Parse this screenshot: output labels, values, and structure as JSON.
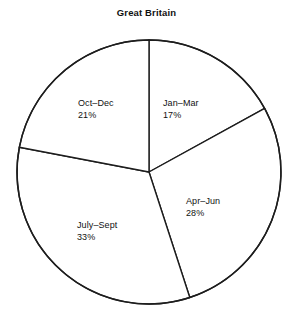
{
  "chart_data": {
    "type": "pie",
    "title": "Great Britain",
    "xlabel": "",
    "ylabel": "",
    "categories": [
      "Jan–Mar",
      "Apr–Jun",
      "July–Sept",
      "Oct–Dec"
    ],
    "values": [
      17,
      28,
      33,
      21
    ],
    "value_labels": [
      "17%",
      "28%",
      "33%",
      "21%"
    ],
    "units": "percent",
    "start_angle_deg": 0,
    "direction": "clockwise",
    "legend": "none",
    "grid": false,
    "slices": [
      {
        "label": "Jan–Mar",
        "value": 17,
        "value_label": "17%",
        "start_deg": 0,
        "end_deg": 61.2,
        "fill": "#ffffff",
        "stroke": "#1d1d1d"
      },
      {
        "label": "Apr–Jun",
        "value": 28,
        "value_label": "28%",
        "start_deg": 61.2,
        "end_deg": 162,
        "fill": "#ffffff",
        "stroke": "#1d1d1d"
      },
      {
        "label": "July–Sept",
        "value": 33,
        "value_label": "33%",
        "start_deg": 162,
        "end_deg": 280.8,
        "fill": "#ffffff",
        "stroke": "#1d1d1d"
      },
      {
        "label": "Oct–Dec",
        "value": 21,
        "value_label": "21%",
        "start_deg": 280.8,
        "end_deg": 360,
        "fill": "#ffffff",
        "stroke": "#1d1d1d"
      }
    ]
  },
  "geometry": {
    "center_x": 149,
    "center_y": 172,
    "radius": 132
  },
  "colors": {
    "background": "#ffffff",
    "stroke": "#1d1d1d",
    "text": "#111111"
  }
}
